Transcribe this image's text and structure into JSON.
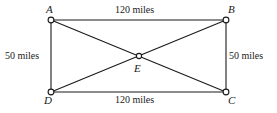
{
  "figure": {
    "type": "geometry-diagram",
    "shape": "rectangle-with-diagonals",
    "stroke_color": "#1a1a1a",
    "vertex_fill_color": "#ffffff",
    "background_color": "#ffffff"
  },
  "vertices": [
    {
      "id": "A",
      "label": "A",
      "x": 51,
      "y": 20,
      "label_x": 46,
      "label_y": 4,
      "marker": "open-circle"
    },
    {
      "id": "B",
      "label": "B",
      "x": 226,
      "y": 20,
      "label_x": 228,
      "label_y": 4,
      "marker": "open-circle"
    },
    {
      "id": "C",
      "label": "C",
      "x": 226,
      "y": 92,
      "label_x": 228,
      "label_y": 95,
      "marker": "open-circle"
    },
    {
      "id": "D",
      "label": "D",
      "x": 51,
      "y": 92,
      "label_x": 44,
      "label_y": 95,
      "marker": "open-circle"
    },
    {
      "id": "E",
      "label": "E",
      "x": 139,
      "y": 56,
      "label_x": 134,
      "label_y": 63,
      "marker": "open-circle"
    }
  ],
  "edges": [
    {
      "id": "AB",
      "from": "A",
      "to": "B",
      "kind": "side"
    },
    {
      "id": "BC",
      "from": "B",
      "to": "C",
      "kind": "side"
    },
    {
      "id": "CD",
      "from": "C",
      "to": "D",
      "kind": "side"
    },
    {
      "id": "DA",
      "from": "D",
      "to": "A",
      "kind": "side"
    },
    {
      "id": "AC",
      "from": "A",
      "to": "C",
      "kind": "diagonal"
    },
    {
      "id": "BD",
      "from": "B",
      "to": "D",
      "kind": "diagonal"
    }
  ],
  "measurements": [
    {
      "id": "top",
      "edge": "AB",
      "text": "120 miles",
      "x": 115,
      "y": 5,
      "align": "left"
    },
    {
      "id": "right",
      "edge": "BC",
      "text": "50 miles",
      "x": 229,
      "y": 51,
      "align": "left"
    },
    {
      "id": "bottom",
      "edge": "CD",
      "text": "120 miles",
      "x": 115,
      "y": 95,
      "align": "left"
    },
    {
      "id": "left",
      "edge": "DA",
      "text": "50 miles",
      "x": 5,
      "y": 51,
      "align": "left"
    }
  ]
}
